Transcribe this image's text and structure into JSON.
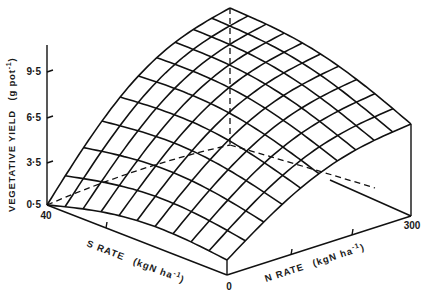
{
  "chart_data": {
    "type": "surface3d",
    "title": "",
    "zlabel": "VEGETATIVE YIELD (g pot⁻¹)",
    "xlabel": "N RATE (kgN ha⁻¹)",
    "ylabel": "S RATE (kgN ha⁻¹)",
    "z_ticks": [
      "0·5",
      "3·5",
      "6·5",
      "9·5"
    ],
    "x_ticks": [
      "0",
      "300"
    ],
    "y_ticks": [
      "40",
      "0"
    ],
    "zlim": [
      0.5,
      11
    ],
    "xlim": [
      0,
      300
    ],
    "ylim": [
      0,
      40
    ],
    "grid": "wireframe 10x10",
    "corner_values": [
      {
        "N": 0,
        "S": 40,
        "yield": 0.5
      },
      {
        "N": 0,
        "S": 0,
        "yield": 1.5
      },
      {
        "N": 300,
        "S": 0,
        "yield": 6.3
      },
      {
        "N": 300,
        "S": 40,
        "yield": 11.0
      }
    ]
  },
  "labels": {
    "z_axis_title_a": "VEGETATIVE YIELD",
    "z_axis_title_b": "(g pot",
    "z_axis_title_sup": "-1",
    "z_axis_title_c": ")",
    "s_axis_title_a": "S RATE",
    "s_axis_title_b": "(kgN ha",
    "s_axis_title_sup": "-1",
    "s_axis_title_c": ")",
    "n_axis_title_a": "N RATE",
    "n_axis_title_b": "(kgN ha",
    "n_axis_title_sup": "-1",
    "n_axis_title_c": ")",
    "tick_z_95": "9·5",
    "tick_z_65": "6·5",
    "tick_z_35": "3·5",
    "tick_z_05": "0·5",
    "tick_s_40": "40",
    "tick_n_0": "0",
    "tick_n_300": "300"
  }
}
